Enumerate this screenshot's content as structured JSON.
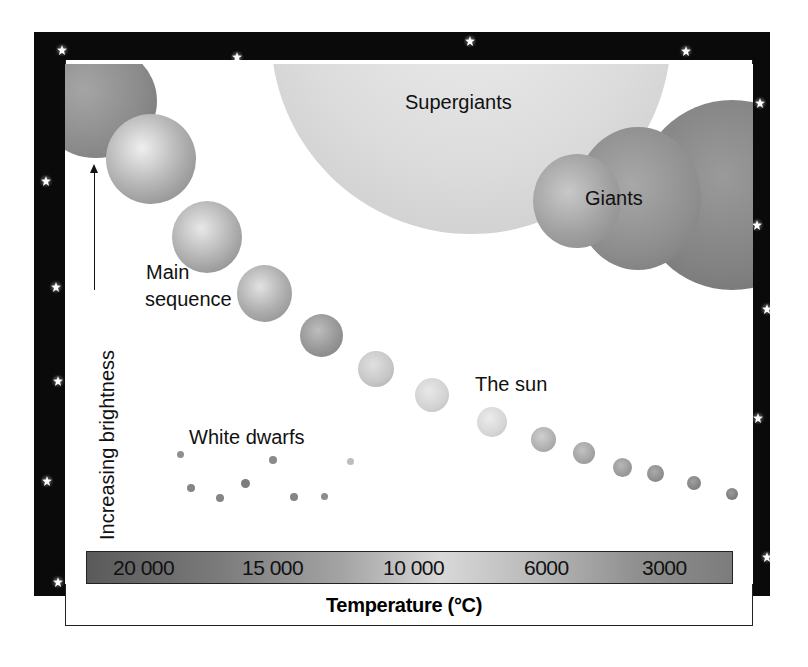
{
  "diagram": {
    "regions": {
      "supergiants": "Supergiants",
      "giants": "Giants",
      "main_sequence_line1": "Main",
      "main_sequence_line2": "sequence",
      "sun": "The sun",
      "white_dwarfs": "White dwarfs"
    },
    "y_axis": {
      "label": "Increasing brightness",
      "direction": "up"
    },
    "x_axis": {
      "title": "Temperature (°C)",
      "ticks": [
        "20 000",
        "15 000",
        "10 000",
        "6000",
        "3000"
      ]
    },
    "colors": {
      "frame": "#0a0a0a",
      "background": "#ffffff",
      "star_glow": "#ffffff",
      "text": "#111111"
    }
  }
}
